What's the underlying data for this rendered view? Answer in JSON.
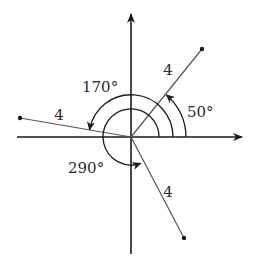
{
  "diagram": {
    "type": "vector-angle-diagram",
    "origin": {
      "x": 131,
      "y": 137
    },
    "axes": {
      "x_axis": {
        "from": [
          17,
          137
        ],
        "to": [
          242,
          137
        ],
        "arrow": "right"
      },
      "y_axis": {
        "from": [
          131,
          254
        ],
        "to": [
          131,
          14
        ],
        "arrow": "up"
      }
    },
    "vectors": [
      {
        "id": "v50",
        "angle_deg": 50,
        "magnitude_label": "4",
        "end": [
          202,
          49
        ],
        "label_pos": [
          168,
          75
        ]
      },
      {
        "id": "v170",
        "angle_deg": 170,
        "magnitude_label": "4",
        "end": [
          20,
          118
        ],
        "label_pos": [
          59,
          120
        ]
      },
      {
        "id": "v290",
        "angle_deg": 290,
        "magnitude_label": "4",
        "end": [
          184,
          238
        ],
        "label_pos": [
          168,
          197
        ]
      }
    ],
    "angle_arcs": [
      {
        "label": "50°",
        "angle_deg": 50,
        "radius": 55,
        "label_pos": [
          187,
          117
        ]
      },
      {
        "label": "170°",
        "angle_deg": 170,
        "radius": 42,
        "label_pos": [
          82,
          92
        ]
      },
      {
        "label": "290°",
        "angle_deg": 290,
        "radius": 28,
        "label_pos": [
          68,
          173
        ]
      }
    ],
    "colors": {
      "line": "#1a1a1a",
      "vector": "#555555",
      "text": "#2a2a2a"
    }
  }
}
